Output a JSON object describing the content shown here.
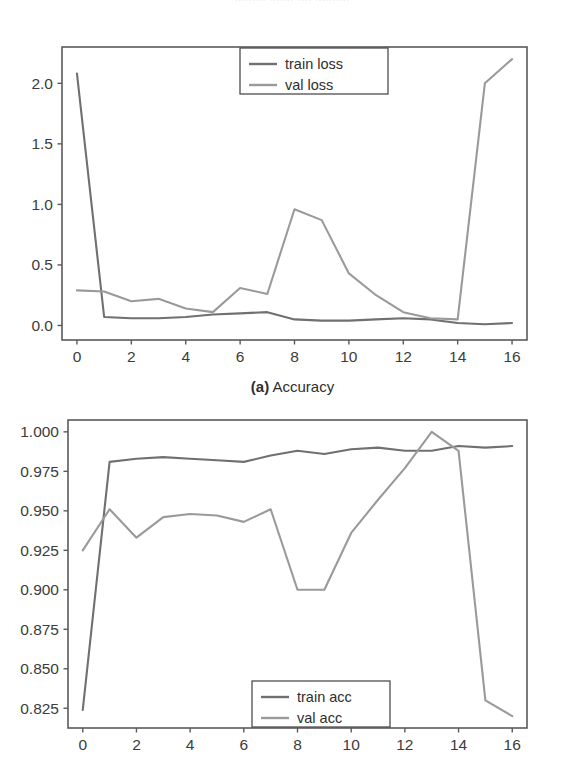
{
  "page": {
    "top_cut_text": "......... ....... .... .........."
  },
  "figures": [
    {
      "id": "loss-chart",
      "caption_prefix": "(a)",
      "caption_text": " Accuracy",
      "legend": [
        {
          "label": "train loss",
          "color": "#707070"
        },
        {
          "label": "val loss",
          "color": "#9a9a9a"
        }
      ],
      "chart_data": {
        "type": "line",
        "title": "",
        "xlabel": "",
        "ylabel": "",
        "xlim": [
          -0.55,
          16.55
        ],
        "ylim": [
          -0.12,
          2.3
        ],
        "xticks": [
          "0",
          "2",
          "4",
          "6",
          "8",
          "10",
          "12",
          "14",
          "16"
        ],
        "xtick_values": [
          0,
          2,
          4,
          6,
          8,
          10,
          12,
          14,
          16
        ],
        "yticks": [
          "0.0",
          "0.5",
          "1.0",
          "1.5",
          "2.0"
        ],
        "ytick_values": [
          0.0,
          0.5,
          1.0,
          1.5,
          2.0
        ],
        "grid": false,
        "legend_position": "upper center",
        "x": [
          0,
          1,
          2,
          3,
          4,
          5,
          6,
          7,
          8,
          9,
          10,
          11,
          12,
          13,
          14,
          15,
          16
        ],
        "series": [
          {
            "name": "train loss",
            "color": "#707070",
            "values": [
              2.08,
              0.07,
              0.06,
              0.06,
              0.07,
              0.09,
              0.1,
              0.11,
              0.05,
              0.04,
              0.04,
              0.05,
              0.06,
              0.05,
              0.02,
              0.01,
              0.02
            ]
          },
          {
            "name": "val loss",
            "color": "#9a9a9a",
            "values": [
              0.29,
              0.28,
              0.2,
              0.22,
              0.14,
              0.11,
              0.31,
              0.26,
              0.96,
              0.87,
              0.43,
              0.25,
              0.11,
              0.06,
              0.05,
              2.0,
              2.2
            ]
          }
        ]
      }
    },
    {
      "id": "accuracy-chart",
      "caption_prefix": "",
      "caption_text": "",
      "legend": [
        {
          "label": "train acc",
          "color": "#707070"
        },
        {
          "label": "val acc",
          "color": "#9a9a9a"
        }
      ],
      "chart_data": {
        "type": "line",
        "title": "",
        "xlabel": "",
        "ylabel": "",
        "xlim": [
          -0.55,
          16.55
        ],
        "ylim": [
          0.8125,
          1.0075
        ],
        "xticks": [
          "0",
          "2",
          "4",
          "6",
          "8",
          "10",
          "12",
          "14",
          "16"
        ],
        "xtick_values": [
          0,
          2,
          4,
          6,
          8,
          10,
          12,
          14,
          16
        ],
        "yticks": [
          "0.825",
          "0.850",
          "0.875",
          "0.900",
          "0.925",
          "0.950",
          "0.975",
          "1.000"
        ],
        "ytick_values": [
          0.825,
          0.85,
          0.875,
          0.9,
          0.925,
          0.95,
          0.975,
          1.0
        ],
        "grid": false,
        "legend_position": "lower center",
        "x": [
          0,
          1,
          2,
          3,
          4,
          5,
          6,
          7,
          8,
          9,
          10,
          11,
          12,
          13,
          14,
          15,
          16
        ],
        "series": [
          {
            "name": "train acc",
            "color": "#707070",
            "values": [
              0.824,
              0.981,
              0.983,
              0.984,
              0.983,
              0.982,
              0.981,
              0.985,
              0.988,
              0.986,
              0.989,
              0.99,
              0.988,
              0.988,
              0.991,
              0.99,
              0.991
            ]
          },
          {
            "name": "val acc",
            "color": "#9a9a9a",
            "values": [
              0.925,
              0.951,
              0.933,
              0.946,
              0.948,
              0.947,
              0.943,
              0.951,
              0.9,
              0.9,
              0.936,
              0.957,
              0.977,
              1.0,
              0.988,
              0.83,
              0.82
            ]
          }
        ]
      }
    }
  ]
}
